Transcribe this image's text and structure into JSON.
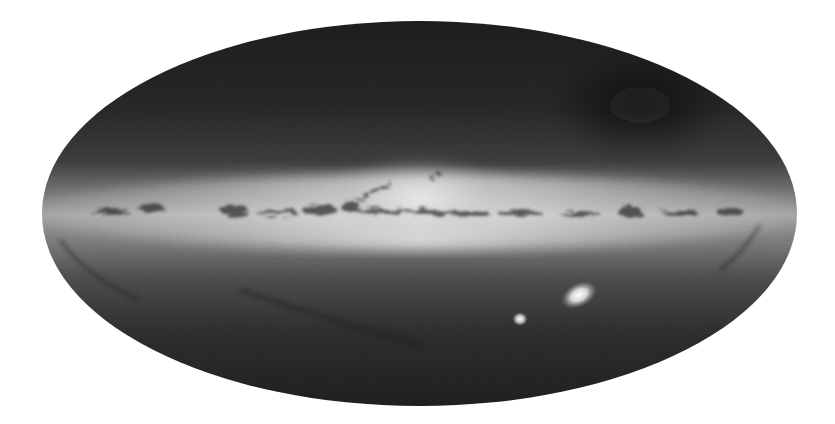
{
  "image": {
    "subject": "All-sky map of the Milky Way galaxy",
    "projection": "mollweide-ellipse",
    "background_color": "#ffffff",
    "ellipse": {
      "cx": 419.5,
      "cy": 213.5,
      "rx": 377.5,
      "ry": 192.5
    },
    "colors": {
      "sky_dark": "#1e1e1e",
      "sky_mid": "#3c3c3c",
      "band_glow": "#9a9a9a",
      "band_core": "#d8d8d8",
      "dust": "#2a2a2a",
      "cloud": "#f2f2f2"
    },
    "features": [
      {
        "name": "galactic-plane-band",
        "y": 210
      },
      {
        "name": "galactic-bulge",
        "x": 420,
        "y": 195
      },
      {
        "name": "large-magellanic-cloud",
        "x": 579,
        "y": 295
      },
      {
        "name": "small-magellanic-cloud",
        "x": 520,
        "y": 319
      }
    ]
  }
}
